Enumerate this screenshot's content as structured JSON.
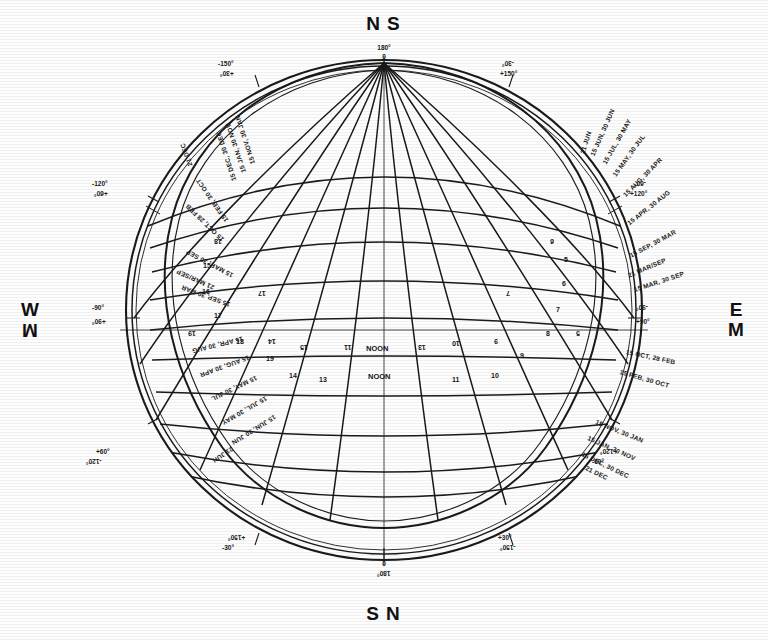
{
  "figure": {
    "kind": "sun-path-stereographic-chart",
    "cardinals": {
      "top_primary": "N",
      "top_secondary": "S",
      "bottom_primary": "S",
      "bottom_secondary": "N",
      "left_primary": "W",
      "left_secondary": "M",
      "right_primary": "E",
      "right_secondary": "M"
    },
    "pole_labels": {
      "top_deg": "180°",
      "top_zero": "0",
      "bottom_zero": "0",
      "bottom_deg": "180°"
    },
    "azimuth_degrees": [
      {
        "text": "-150°",
        "pair": "+30°",
        "position": "top-left"
      },
      {
        "text": "-30°",
        "pair": "+150°",
        "position": "top-right"
      },
      {
        "text": "-120°",
        "pair": "+60°",
        "position": "upper-left"
      },
      {
        "text": "-60°",
        "pair": "+120°",
        "position": "upper-right"
      },
      {
        "text": "-90°",
        "pair": "+90°",
        "position": "left"
      },
      {
        "text": "-90°",
        "pair": "+90°",
        "position": "right"
      },
      {
        "text": "+60°",
        "pair": "-120°",
        "position": "lower-left"
      },
      {
        "text": "+120°",
        "pair": "-60°",
        "position": "lower-right"
      },
      {
        "text": "+150°",
        "pair": "-30°",
        "position": "bottom-left"
      },
      {
        "text": "+30°",
        "pair": "-150°",
        "position": "bottom-right"
      }
    ],
    "date_labels_right": [
      "21 JUN",
      "15 JUN, 30 JUN",
      "15 JUL, 30 MAY",
      "15 MAY, 30 JUL",
      "15 AUG, 30 APR",
      "15 APR, 30 AUG",
      "15 SEP, 30 MAR",
      "21 MAR/SEP",
      "15 MAR, 30 SEP",
      "15 OCT, 28 FEB",
      "15 FEB, 30 OCT",
      "15 NOV, 30 JAN",
      "15 JAN, 30 NOV",
      "15 DEC, 30 DEC",
      "21 DEC"
    ],
    "date_labels_left": [
      "15 NOV, 30 JAN",
      "15 JAN, 30 NOV",
      "15 DEC, 30 DEC",
      "21 DEC",
      "15 FEB, 30 OCT",
      "15 OCT, 28 FEB",
      "15 MAR, 30 SEP",
      "21 MAR/SEP",
      "15 SEP, 30 MAR",
      "15 APR, 30 AUG",
      "15 AUG, 30 APR",
      "15 MAY, 30 JUL",
      "15 JUL, 30 MAY",
      "15 JUN, 30 JUN",
      "21 JUN"
    ],
    "hour_labels": [
      "5",
      "6",
      "7",
      "8",
      "9",
      "10",
      "11",
      "NOON",
      "13",
      "14",
      "15",
      "16",
      "17",
      "18",
      "19"
    ],
    "hour_labels_left": [
      "19",
      "18",
      "17",
      "16",
      "15",
      "14",
      "13"
    ],
    "hour_labels_right": [
      "11",
      "10",
      "9",
      "8",
      "7",
      "6",
      "5"
    ],
    "noon_label": "NOON",
    "colors": {
      "ink": "#151515",
      "paper": "#fdfdfd",
      "line": "#1a1a1a"
    }
  }
}
